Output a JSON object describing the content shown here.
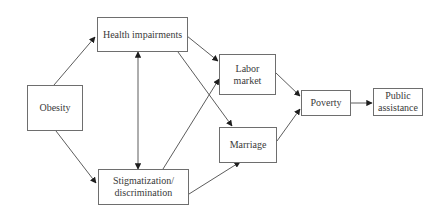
{
  "diagram": {
    "nodes": [
      {
        "id": "obesity",
        "label": "Obesity",
        "x": 27,
        "y": 85,
        "w": 56,
        "h": 46
      },
      {
        "id": "health",
        "label": "Health impairments",
        "x": 97,
        "y": 17,
        "w": 91,
        "h": 35
      },
      {
        "id": "stigma",
        "label": "Stigmatization/\ndiscrimination",
        "x": 98,
        "y": 169,
        "w": 91,
        "h": 36
      },
      {
        "id": "labor",
        "label": "Labor\nmarket",
        "x": 219,
        "y": 54,
        "w": 57,
        "h": 41
      },
      {
        "id": "marriage",
        "label": "Marriage",
        "x": 219,
        "y": 127,
        "w": 58,
        "h": 36
      },
      {
        "id": "poverty",
        "label": "Poverty",
        "x": 301,
        "y": 90,
        "w": 50,
        "h": 26
      },
      {
        "id": "assistance",
        "label": "Public\nassistance",
        "x": 373,
        "y": 88,
        "w": 50,
        "h": 28
      }
    ],
    "edges": [
      {
        "from": "obesity",
        "to": "health",
        "x1": 54,
        "y1": 85,
        "x2": 95,
        "y2": 37,
        "bidirectional": false
      },
      {
        "from": "obesity",
        "to": "stigma",
        "x1": 56,
        "y1": 131,
        "x2": 96,
        "y2": 183,
        "bidirectional": false
      },
      {
        "from": "health",
        "to": "stigma",
        "x1": 138,
        "y1": 52,
        "x2": 138,
        "y2": 169,
        "bidirectional": true
      },
      {
        "from": "health",
        "to": "labor",
        "x1": 187,
        "y1": 36,
        "x2": 218,
        "y2": 61,
        "bidirectional": false
      },
      {
        "from": "health",
        "to": "marriage",
        "x1": 178,
        "y1": 52,
        "x2": 232,
        "y2": 126,
        "bidirectional": false
      },
      {
        "from": "stigma",
        "to": "labor",
        "x1": 163,
        "y1": 169,
        "x2": 219,
        "y2": 79,
        "bidirectional": false
      },
      {
        "from": "stigma",
        "to": "marriage",
        "x1": 189,
        "y1": 194,
        "x2": 240,
        "y2": 162,
        "bidirectional": false
      },
      {
        "from": "labor",
        "to": "poverty",
        "x1": 276,
        "y1": 73,
        "x2": 300,
        "y2": 96,
        "bidirectional": false
      },
      {
        "from": "marriage",
        "to": "poverty",
        "x1": 277,
        "y1": 141,
        "x2": 300,
        "y2": 109,
        "bidirectional": false
      },
      {
        "from": "poverty",
        "to": "assistance",
        "x1": 351,
        "y1": 103,
        "x2": 372,
        "y2": 103,
        "bidirectional": false
      }
    ]
  },
  "colors": {
    "line": "#4a4a4a",
    "border": "#6e6e6e",
    "text": "#3a3a3a"
  }
}
